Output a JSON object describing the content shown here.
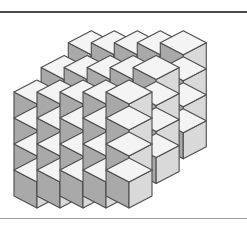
{
  "figure": {
    "background_color": "#ffffff",
    "rules": [
      {
        "name": "top-rule",
        "y": 11,
        "thickness": 2,
        "color": "#4a4a4a"
      },
      {
        "name": "bottom-rule",
        "y": 218,
        "thickness": 1,
        "color": "#9a9a9a"
      }
    ]
  },
  "palette": {
    "top_face": "#f4f4f4",
    "left_face": "#a9a9a9",
    "right_face": "#d9d9d9",
    "outline": "#4d4d4d",
    "outline_width": 1.1
  },
  "projection": {
    "type": "isometric",
    "cube_half_width": 23,
    "cube_height": 26,
    "cube_depth_rise": 12,
    "origin_x": 14,
    "origin_y": 196
  },
  "chart_data": {
    "type": "scatter",
    "xlabel": "",
    "ylabel": "",
    "slabs": [
      {
        "name": "front-slab",
        "columns": 5,
        "rows": 4,
        "depth_index": 0,
        "total_cubes": 20
      },
      {
        "name": "middle-slab",
        "columns": 5,
        "rows": 4,
        "depth_index": 1,
        "total_cubes": 20
      },
      {
        "name": "back-slab",
        "columns": 5,
        "rows": 4,
        "depth_index": 2,
        "total_cubes": 20
      }
    ],
    "total_cubes": 60,
    "gaps_between_slabs": 2,
    "stack_height_cubes": 4
  },
  "geometry": {
    "cubes": [
      {
        "s": 2,
        "c": 0,
        "r": 0
      },
      {
        "s": 2,
        "c": 1,
        "r": 0
      },
      {
        "s": 2,
        "c": 2,
        "r": 0
      },
      {
        "s": 2,
        "c": 3,
        "r": 0
      },
      {
        "s": 2,
        "c": 4,
        "r": 0
      },
      {
        "s": 2,
        "c": 0,
        "r": 1
      },
      {
        "s": 2,
        "c": 1,
        "r": 1
      },
      {
        "s": 2,
        "c": 2,
        "r": 1
      },
      {
        "s": 2,
        "c": 3,
        "r": 1
      },
      {
        "s": 2,
        "c": 4,
        "r": 1
      },
      {
        "s": 2,
        "c": 0,
        "r": 2
      },
      {
        "s": 2,
        "c": 1,
        "r": 2
      },
      {
        "s": 2,
        "c": 2,
        "r": 2
      },
      {
        "s": 2,
        "c": 3,
        "r": 2
      },
      {
        "s": 2,
        "c": 4,
        "r": 2
      },
      {
        "s": 2,
        "c": 0,
        "r": 3
      },
      {
        "s": 2,
        "c": 1,
        "r": 3
      },
      {
        "s": 2,
        "c": 2,
        "r": 3
      },
      {
        "s": 2,
        "c": 3,
        "r": 3
      },
      {
        "s": 2,
        "c": 4,
        "r": 3
      },
      {
        "s": 1,
        "c": 0,
        "r": 0
      },
      {
        "s": 1,
        "c": 1,
        "r": 0
      },
      {
        "s": 1,
        "c": 2,
        "r": 0
      },
      {
        "s": 1,
        "c": 3,
        "r": 0
      },
      {
        "s": 1,
        "c": 4,
        "r": 0
      },
      {
        "s": 1,
        "c": 0,
        "r": 1
      },
      {
        "s": 1,
        "c": 1,
        "r": 1
      },
      {
        "s": 1,
        "c": 2,
        "r": 1
      },
      {
        "s": 1,
        "c": 3,
        "r": 1
      },
      {
        "s": 1,
        "c": 4,
        "r": 1
      },
      {
        "s": 1,
        "c": 0,
        "r": 2
      },
      {
        "s": 1,
        "c": 1,
        "r": 2
      },
      {
        "s": 1,
        "c": 2,
        "r": 2
      },
      {
        "s": 1,
        "c": 3,
        "r": 2
      },
      {
        "s": 1,
        "c": 4,
        "r": 2
      },
      {
        "s": 1,
        "c": 0,
        "r": 3
      },
      {
        "s": 1,
        "c": 1,
        "r": 3
      },
      {
        "s": 1,
        "c": 2,
        "r": 3
      },
      {
        "s": 1,
        "c": 3,
        "r": 3
      },
      {
        "s": 1,
        "c": 4,
        "r": 3
      },
      {
        "s": 0,
        "c": 0,
        "r": 0
      },
      {
        "s": 0,
        "c": 1,
        "r": 0
      },
      {
        "s": 0,
        "c": 2,
        "r": 0
      },
      {
        "s": 0,
        "c": 3,
        "r": 0
      },
      {
        "s": 0,
        "c": 4,
        "r": 0
      },
      {
        "s": 0,
        "c": 0,
        "r": 1
      },
      {
        "s": 0,
        "c": 1,
        "r": 1
      },
      {
        "s": 0,
        "c": 2,
        "r": 1
      },
      {
        "s": 0,
        "c": 3,
        "r": 1
      },
      {
        "s": 0,
        "c": 4,
        "r": 1
      },
      {
        "s": 0,
        "c": 0,
        "r": 2
      },
      {
        "s": 0,
        "c": 1,
        "r": 2
      },
      {
        "s": 0,
        "c": 2,
        "r": 2
      },
      {
        "s": 0,
        "c": 3,
        "r": 2
      },
      {
        "s": 0,
        "c": 4,
        "r": 2
      },
      {
        "s": 0,
        "c": 0,
        "r": 3
      },
      {
        "s": 0,
        "c": 1,
        "r": 3
      },
      {
        "s": 0,
        "c": 2,
        "r": 3
      },
      {
        "s": 0,
        "c": 3,
        "r": 3
      },
      {
        "s": 0,
        "c": 4,
        "r": 3
      }
    ]
  }
}
